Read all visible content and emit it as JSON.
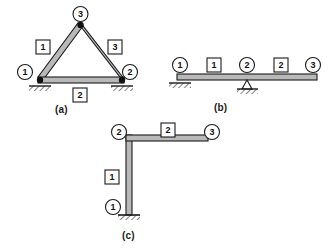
{
  "figure": {
    "background_color": "#ffffff",
    "line_color": "#1a1a1a",
    "member_fill": "#b9b9b9",
    "panels": [
      {
        "caption": "(a)",
        "type": "triangular-truss",
        "nodes": [
          {
            "id": "1",
            "label": "1",
            "support": "pinned-hatched"
          },
          {
            "id": "2",
            "label": "2",
            "support": "pinned-hatched"
          },
          {
            "id": "3",
            "label": "3",
            "support": "none"
          }
        ],
        "members": [
          {
            "id": "1",
            "label": "1",
            "from": "1",
            "to": "3"
          },
          {
            "id": "2",
            "label": "2",
            "from": "1",
            "to": "2"
          },
          {
            "id": "3",
            "label": "3",
            "from": "3",
            "to": "2"
          }
        ]
      },
      {
        "caption": "(b)",
        "type": "continuous-beam",
        "nodes": [
          {
            "id": "1",
            "label": "1",
            "support": "pinned-hatched"
          },
          {
            "id": "2",
            "label": "2",
            "support": "roller-triangle-hatched"
          },
          {
            "id": "3",
            "label": "3",
            "support": "free-end"
          }
        ],
        "members": [
          {
            "id": "1",
            "label": "1",
            "from": "1",
            "to": "2"
          },
          {
            "id": "2",
            "label": "2",
            "from": "2",
            "to": "3"
          }
        ]
      },
      {
        "caption": "(c)",
        "type": "L-frame",
        "nodes": [
          {
            "id": "1",
            "label": "1",
            "support": "fixed-hatched"
          },
          {
            "id": "2",
            "label": "2",
            "support": "rigid-corner"
          },
          {
            "id": "3",
            "label": "3",
            "support": "free-end"
          }
        ],
        "members": [
          {
            "id": "1",
            "label": "1",
            "from": "1",
            "to": "2"
          },
          {
            "id": "2",
            "label": "2",
            "from": "2",
            "to": "3"
          }
        ]
      }
    ]
  },
  "labels": {
    "a": {
      "caption": "(a)",
      "n1": "1",
      "n2": "2",
      "n3": "3",
      "m1": "1",
      "m2": "2",
      "m3": "3"
    },
    "b": {
      "caption": "(b)",
      "n1": "1",
      "n2": "2",
      "n3": "3",
      "m1": "1",
      "m2": "2"
    },
    "c": {
      "caption": "(c)",
      "n1": "1",
      "n2": "2",
      "n3": "3",
      "m1": "1",
      "m2": "2"
    }
  }
}
